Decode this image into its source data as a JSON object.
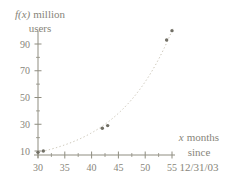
{
  "figure": {
    "background": "#ffffff"
  },
  "chart_data": {
    "type": "scatter",
    "title": "",
    "ylabel": "f(x) million users",
    "ylabel_lines": [
      {
        "italic": "f(x)",
        "rest": "million"
      },
      {
        "italic": "",
        "rest": "users"
      }
    ],
    "xlabel": "x months since 12/31/03",
    "xlabel_lines": [
      {
        "italic": "x",
        "rest": "months"
      },
      {
        "italic": "",
        "rest": "since"
      },
      {
        "italic": "",
        "rest": "12/31/03"
      }
    ],
    "points": [
      {
        "x": 30,
        "y": 9
      },
      {
        "x": 31,
        "y": 10
      },
      {
        "x": 42,
        "y": 27
      },
      {
        "x": 43,
        "y": 29
      },
      {
        "x": 54,
        "y": 93
      },
      {
        "x": 55,
        "y": 100
      }
    ],
    "x_ticks": [
      30,
      35,
      40,
      45,
      50,
      55
    ],
    "y_ticks": [
      10,
      30,
      50,
      70,
      90
    ],
    "x_minor_ticks": [
      32.5,
      37.5,
      42.5,
      47.5,
      52.5
    ],
    "y_minor_ticks": [
      20,
      40,
      60,
      80
    ],
    "xlim": [
      30,
      56
    ],
    "ylim": [
      5,
      103
    ],
    "grid": false,
    "legend": null,
    "curve": {
      "type": "exponential",
      "style": "dotted",
      "x_start": 30,
      "x_end": 55.4
    },
    "colors": {
      "axis": "#8f8d80",
      "text": "#87857a",
      "curve": "#c9c3b4",
      "points": "#716f65"
    }
  }
}
